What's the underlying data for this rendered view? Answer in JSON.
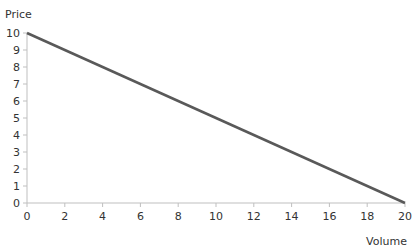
{
  "chart_data": {
    "type": "line",
    "title": "",
    "xlabel": "Volume",
    "ylabel": "Price",
    "xlim": [
      0,
      20
    ],
    "ylim": [
      0,
      10
    ],
    "x_ticks": [
      0,
      2,
      4,
      6,
      8,
      10,
      12,
      14,
      16,
      18,
      20
    ],
    "y_ticks": [
      0,
      1,
      2,
      3,
      4,
      5,
      6,
      7,
      8,
      9,
      10
    ],
    "grid": false,
    "legend": "none",
    "series": [
      {
        "name": "Demand",
        "color": "#595959",
        "x": [
          0,
          20
        ],
        "y": [
          10,
          0
        ]
      }
    ]
  }
}
